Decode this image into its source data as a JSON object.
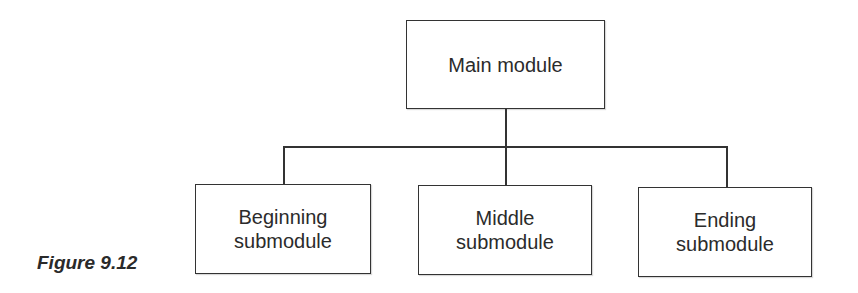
{
  "diagram": {
    "type": "hierarchy-chart",
    "root": {
      "label": "Main module"
    },
    "children": [
      {
        "label": "Beginning\nsubmodule"
      },
      {
        "label": "Middle\nsubmodule"
      },
      {
        "label": "Ending\nsubmodule"
      }
    ]
  },
  "caption": "Figure 9.12"
}
